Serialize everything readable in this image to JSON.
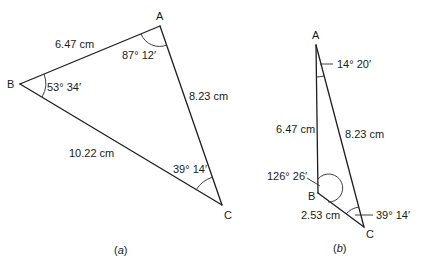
{
  "figures": [
    {
      "id": "a",
      "caption": {
        "open": "(",
        "letter": "a",
        "close": ")"
      },
      "vertices": {
        "A": {
          "label": "A"
        },
        "B": {
          "label": "B"
        },
        "C": {
          "label": "C"
        }
      },
      "sides": {
        "AB": "6.47 cm",
        "AC": "8.23 cm",
        "BC": "10.22 cm"
      },
      "angles": {
        "A": "87° 12′",
        "B": "53° 34′",
        "C": "39° 14′"
      }
    },
    {
      "id": "b",
      "caption": {
        "open": "(",
        "letter": "b",
        "close": ")"
      },
      "vertices": {
        "A": {
          "label": "A"
        },
        "B": {
          "label": "B"
        },
        "C": {
          "label": "C"
        }
      },
      "sides": {
        "AB": "6.47 cm",
        "AC": "8.23 cm",
        "BC": "2.53 cm"
      },
      "angles": {
        "A": "14° 20′",
        "B": "126° 26′",
        "C": "39° 14′"
      }
    }
  ],
  "colors": {
    "line": "#1e1e1e",
    "text": "#1a1a1a",
    "background": "#ffffff"
  }
}
